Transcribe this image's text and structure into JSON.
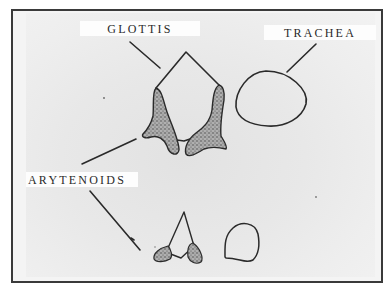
{
  "diagram": {
    "type": "anatomical illustration",
    "labels": {
      "glottis": "GLOTTIS",
      "trachea": "TRACHEA",
      "arytenoids": "ARYTENOIDS"
    },
    "nodes": [
      {
        "id": "glottis-open",
        "label": "GLOTTIS",
        "description": "upper figure: open glottis (pentagonal opening) between two stippled arytenoid cartilages"
      },
      {
        "id": "trachea-upper",
        "label": "TRACHEA",
        "description": "upper-right rounded outline of tracheal cross-section"
      },
      {
        "id": "arytenoids",
        "label": "ARYTENOIDS",
        "description": "stippled cartilages pointed to by two leader lines"
      },
      {
        "id": "glottis-narrow",
        "label": "",
        "description": "lower figure: narrowed triangular glottis with small arytenoids"
      },
      {
        "id": "trachea-lower",
        "label": "",
        "description": "lower-right small outline of tracheal cross-section"
      }
    ],
    "edges": [
      {
        "from": "glottis",
        "to": "glottis-open",
        "kind": "leader-line"
      },
      {
        "from": "trachea",
        "to": "trachea-upper",
        "kind": "leader-line"
      },
      {
        "from": "arytenoids",
        "to": "arytenoids (upper figure)",
        "kind": "leader-line"
      },
      {
        "from": "arytenoids",
        "to": "arytenoids (lower figure)",
        "kind": "leader-line"
      }
    ],
    "colors": {
      "ink": "#2a2a2a",
      "stipple_fill": "#9a9a9a",
      "paper": "#e8e8e8",
      "frame": "#3a3a3a"
    }
  }
}
